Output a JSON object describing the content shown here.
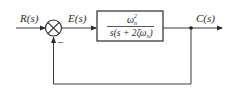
{
  "diagram": {
    "type": "closed-loop block diagram",
    "input_label": "R(s)",
    "error_label": "E(s)",
    "output_label": "C(s)",
    "feedback_sign": "−",
    "summing_junction": "summing-junction",
    "block": {
      "numerator_base": "ω",
      "numerator_sub": "n",
      "numerator_sup": "2",
      "denominator_prefix": "s(s + 2ζω",
      "denominator_sub": "n",
      "denominator_suffix": ")"
    },
    "colors": {
      "line": "#3a3a3a",
      "text": "#2a2a2a",
      "background": "#ffffff"
    }
  }
}
